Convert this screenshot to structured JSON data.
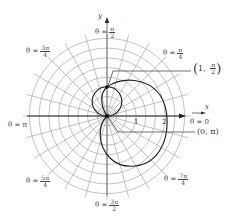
{
  "figure": {
    "origin": {
      "x": 107,
      "y": 116
    },
    "unit_px": 29,
    "ring_count": 8,
    "ring_step_px": 9.7,
    "ray_step_deg": 15,
    "ray_length_px": 84,
    "grid_color": "#9a9a9a",
    "curve_color": "#222222"
  },
  "axes": {
    "x_label": "x",
    "y_label": "y",
    "ticks": [
      "1",
      "2"
    ]
  },
  "angle_labels": [
    {
      "id": "pi-over-2",
      "prefix": "θ =",
      "num": "π",
      "den": "2"
    },
    {
      "id": "pi-over-4",
      "prefix": "θ =",
      "num": "π",
      "den": "4"
    },
    {
      "id": "3pi-over-4",
      "prefix": "θ =",
      "num": "3π",
      "den": "4"
    },
    {
      "id": "pi",
      "text": "θ = π"
    },
    {
      "id": "zero",
      "text": "θ = 0"
    },
    {
      "id": "5pi-over-4",
      "prefix": "θ =",
      "num": "5π",
      "den": "4"
    },
    {
      "id": "7pi-over-4",
      "prefix": "θ =",
      "num": "7π",
      "den": "4"
    },
    {
      "id": "3pi-over-2",
      "prefix": "θ =",
      "num": "3π",
      "den": "2"
    }
  ],
  "point_labels": {
    "p1": {
      "r": "1",
      "num": "π",
      "den": "2"
    },
    "p2": {
      "text": "(0, π)"
    }
  },
  "curves": [
    {
      "name": "small-circle",
      "description": "circle through origin and (1, π/2)"
    },
    {
      "name": "large-curve",
      "description": "curve through (0, π), (1, π/2), and r = 2 at θ = 0"
    }
  ]
}
